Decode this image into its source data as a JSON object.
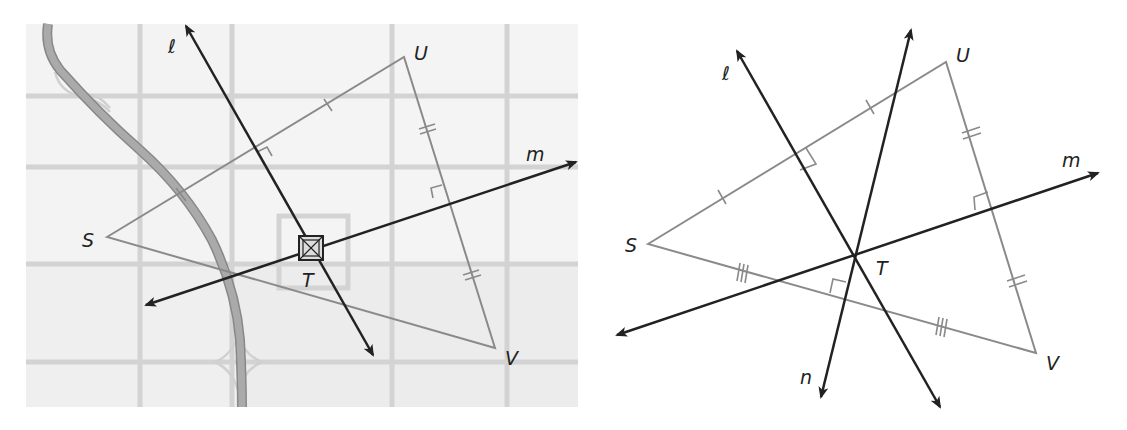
{
  "figures": [
    {
      "id": "map-figure",
      "description": "Triangle STU V on a city map with perpendicular bisectors",
      "points": {
        "S": {
          "label": "S",
          "x": 107,
          "y": 237
        },
        "U": {
          "label": "U",
          "x": 404,
          "y": 57
        },
        "V": {
          "label": "V",
          "x": 495,
          "y": 348
        },
        "T": {
          "label": "T",
          "x": 310,
          "y": 249
        }
      },
      "lines": {
        "l": {
          "label": "ℓ"
        },
        "m": {
          "label": "m"
        }
      }
    },
    {
      "id": "geometry-figure",
      "description": "Triangle SUV with perpendicular bisectors ℓ, m, n meeting at T",
      "points": {
        "S": {
          "label": "S",
          "x": 648,
          "y": 244
        },
        "U": {
          "label": "U",
          "x": 946,
          "y": 62
        },
        "V": {
          "label": "V",
          "x": 1036,
          "y": 353
        },
        "T": {
          "label": "T",
          "x": 855,
          "y": 255
        }
      },
      "lines": {
        "l": {
          "label": "ℓ"
        },
        "m": {
          "label": "m"
        },
        "n": {
          "label": "n"
        }
      }
    }
  ],
  "colors": {
    "map_bg": "#ececec",
    "map_block_light": "#f3f3f3",
    "map_road": "#d2d2d2",
    "highway": "#a8a8a8",
    "triangle": "#8a8a8a",
    "bisector": "#222222"
  }
}
